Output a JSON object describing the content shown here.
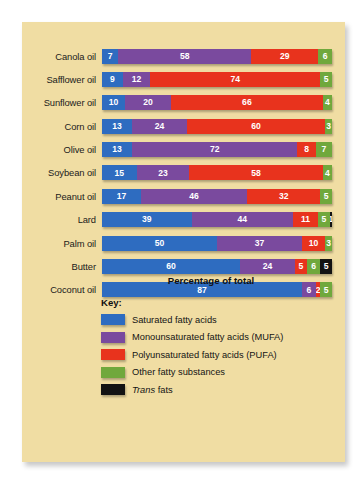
{
  "chart_data": {
    "type": "bar",
    "subtype": "stacked-horizontal-100",
    "title": "",
    "xlabel": "Percentage of total",
    "ylabel": "",
    "xlim": [
      0,
      100
    ],
    "grid": false,
    "legend_position": "below",
    "categories": [
      "Canola oil",
      "Safflower oil",
      "Sunflower oil",
      "Corn oil",
      "Olive oil",
      "Soybean oil",
      "Peanut oil",
      "Lard",
      "Palm oil",
      "Butter",
      "Coconut oil"
    ],
    "series": [
      {
        "name": "Saturated fatty acids",
        "color": "#2e6cc0",
        "values": [
          7,
          9,
          10,
          13,
          13,
          15,
          17,
          39,
          50,
          60,
          87
        ]
      },
      {
        "name": "Monounsaturated fatty acids (MUFA)",
        "color": "#7a4a9e",
        "values": [
          58,
          12,
          20,
          24,
          72,
          23,
          46,
          44,
          37,
          24,
          6
        ]
      },
      {
        "name": "Polyunsaturated fatty acids (PUFA)",
        "color": "#e8331d",
        "values": [
          29,
          74,
          66,
          60,
          8,
          58,
          32,
          11,
          10,
          5,
          2
        ]
      },
      {
        "name": "Other fatty substances",
        "color": "#70a83c",
        "values": [
          6,
          5,
          4,
          3,
          7,
          4,
          5,
          5,
          3,
          6,
          5
        ]
      },
      {
        "name": "Trans fats",
        "color": "#131313",
        "values": [
          0,
          0,
          0,
          0,
          0,
          0,
          0,
          1,
          0,
          5,
          0
        ]
      }
    ],
    "rows": [
      {
        "label": "Canola oil",
        "segments": [
          {
            "key": "sat",
            "value": 7,
            "label": "7"
          },
          {
            "key": "mufa",
            "value": 58,
            "label": "58"
          },
          {
            "key": "pufa",
            "value": 29,
            "label": "29"
          },
          {
            "key": "other",
            "value": 6,
            "label": "6"
          }
        ]
      },
      {
        "label": "Safflower oil",
        "segments": [
          {
            "key": "sat",
            "value": 9,
            "label": "9"
          },
          {
            "key": "mufa",
            "value": 12,
            "label": "12"
          },
          {
            "key": "pufa",
            "value": 74,
            "label": "74"
          },
          {
            "key": "other",
            "value": 5,
            "label": "5"
          }
        ]
      },
      {
        "label": "Sunflower oil",
        "segments": [
          {
            "key": "sat",
            "value": 10,
            "label": "10"
          },
          {
            "key": "mufa",
            "value": 20,
            "label": "20"
          },
          {
            "key": "pufa",
            "value": 66,
            "label": "66"
          },
          {
            "key": "other",
            "value": 4,
            "label": "4"
          }
        ]
      },
      {
        "label": "Corn oil",
        "segments": [
          {
            "key": "sat",
            "value": 13,
            "label": "13"
          },
          {
            "key": "mufa",
            "value": 24,
            "label": "24"
          },
          {
            "key": "pufa",
            "value": 60,
            "label": "60"
          },
          {
            "key": "other",
            "value": 3,
            "label": "3"
          }
        ]
      },
      {
        "label": "Olive oil",
        "segments": [
          {
            "key": "sat",
            "value": 13,
            "label": "13"
          },
          {
            "key": "mufa",
            "value": 72,
            "label": "72"
          },
          {
            "key": "pufa",
            "value": 8,
            "label": "8"
          },
          {
            "key": "other",
            "value": 7,
            "label": "7"
          }
        ]
      },
      {
        "label": "Soybean oil",
        "segments": [
          {
            "key": "sat",
            "value": 15,
            "label": "15"
          },
          {
            "key": "mufa",
            "value": 23,
            "label": "23"
          },
          {
            "key": "pufa",
            "value": 58,
            "label": "58"
          },
          {
            "key": "other",
            "value": 4,
            "label": "4"
          }
        ]
      },
      {
        "label": "Peanut oil",
        "segments": [
          {
            "key": "sat",
            "value": 17,
            "label": "17"
          },
          {
            "key": "mufa",
            "value": 46,
            "label": "46"
          },
          {
            "key": "pufa",
            "value": 32,
            "label": "32"
          },
          {
            "key": "other",
            "value": 5,
            "label": "5"
          }
        ]
      },
      {
        "label": "Lard",
        "segments": [
          {
            "key": "sat",
            "value": 39,
            "label": "39"
          },
          {
            "key": "mufa",
            "value": 44,
            "label": "44"
          },
          {
            "key": "pufa",
            "value": 11,
            "label": "11"
          },
          {
            "key": "other",
            "value": 5,
            "label": "5"
          },
          {
            "key": "trans",
            "value": 1,
            "label": "1"
          }
        ]
      },
      {
        "label": "Palm oil",
        "segments": [
          {
            "key": "sat",
            "value": 50,
            "label": "50"
          },
          {
            "key": "mufa",
            "value": 37,
            "label": "37"
          },
          {
            "key": "pufa",
            "value": 10,
            "label": "10"
          },
          {
            "key": "other",
            "value": 3,
            "label": "3"
          }
        ]
      },
      {
        "label": "Butter",
        "segments": [
          {
            "key": "sat",
            "value": 60,
            "label": "60"
          },
          {
            "key": "mufa",
            "value": 24,
            "label": "24"
          },
          {
            "key": "pufa",
            "value": 5,
            "label": "5"
          },
          {
            "key": "other",
            "value": 6,
            "label": "6"
          },
          {
            "key": "trans",
            "value": 5,
            "label": "5"
          }
        ]
      },
      {
        "label": "Coconut oil",
        "segments": [
          {
            "key": "sat",
            "value": 87,
            "label": "87"
          },
          {
            "key": "mufa",
            "value": 6,
            "label": "6"
          },
          {
            "key": "pufa",
            "value": 2,
            "label": "2"
          },
          {
            "key": "other",
            "value": 5,
            "label": "5"
          }
        ]
      }
    ]
  },
  "axis": {
    "x_title": "Percentage of total"
  },
  "key": {
    "title": "Key:",
    "items": [
      {
        "key": "sat",
        "label": "Saturated fatty acids",
        "color": "#2e6cc0",
        "italic_prefix": ""
      },
      {
        "key": "mufa",
        "label": "Monounsaturated fatty acids (MUFA)",
        "color": "#7a4a9e",
        "italic_prefix": ""
      },
      {
        "key": "pufa",
        "label": "Polyunsaturated fatty acids (PUFA)",
        "color": "#e8331d",
        "italic_prefix": ""
      },
      {
        "key": "other",
        "label": "Other fatty substances",
        "color": "#70a83c",
        "italic_prefix": ""
      },
      {
        "key": "trans",
        "label": "fats",
        "color": "#131313",
        "italic_prefix": "Trans"
      }
    ]
  },
  "colors": {
    "panel_background": "#f0dda3",
    "page_background": "#ffffff",
    "saturated": "#2e6cc0",
    "mufa": "#7a4a9e",
    "pufa": "#e8331d",
    "other": "#70a83c",
    "trans": "#131313",
    "text": "#141414"
  }
}
